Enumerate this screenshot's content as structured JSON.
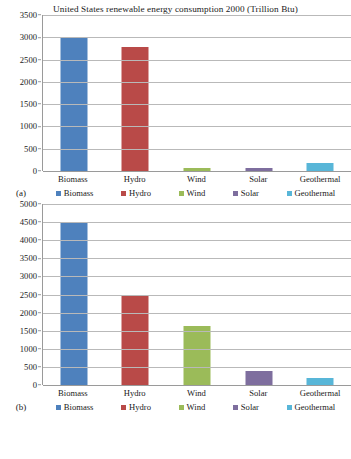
{
  "chart_data": [
    {
      "type": "bar",
      "panel": "(a)",
      "title": "United States renewable energy consumption 2000 (Trillion Btu)",
      "categories": [
        "Biomass",
        "Hydro",
        "Wind",
        "Solar",
        "Geothermal"
      ],
      "values": [
        2990,
        2780,
        60,
        65,
        170
      ],
      "xlabel": "",
      "ylabel": "",
      "ylim": [
        0,
        3500
      ],
      "ytick_step": 500,
      "yticks": [
        "3500",
        "3000",
        "2500",
        "2000",
        "1500",
        "1000",
        "500",
        "0"
      ],
      "grid": true,
      "legend": [
        "Biomass",
        "Hydro",
        "Wind",
        "Solar",
        "Geothermal"
      ],
      "legend_position": "bottom",
      "colors": [
        "#4e81bd",
        "#b94a48",
        "#9bbb59",
        "#7e6e9e",
        "#58b6d8"
      ]
    },
    {
      "type": "bar",
      "panel": "(b)",
      "title": "",
      "categories": [
        "Biomass",
        "Hydro",
        "Wind",
        "Solar",
        "Geothermal"
      ],
      "values": [
        4480,
        2490,
        1620,
        390,
        180
      ],
      "xlabel": "",
      "ylabel": "",
      "ylim": [
        0,
        5000
      ],
      "ytick_step": 500,
      "yticks": [
        "5000",
        "4500",
        "4000",
        "3500",
        "3000",
        "2500",
        "2000",
        "1500",
        "1000",
        "500",
        "0"
      ],
      "grid": true,
      "legend": [
        "Biomass",
        "Hydro",
        "Wind",
        "Solar",
        "Geothermal"
      ],
      "legend_position": "bottom",
      "colors": [
        "#4e81bd",
        "#b94a48",
        "#9bbb59",
        "#7e6e9e",
        "#58b6d8"
      ]
    }
  ]
}
